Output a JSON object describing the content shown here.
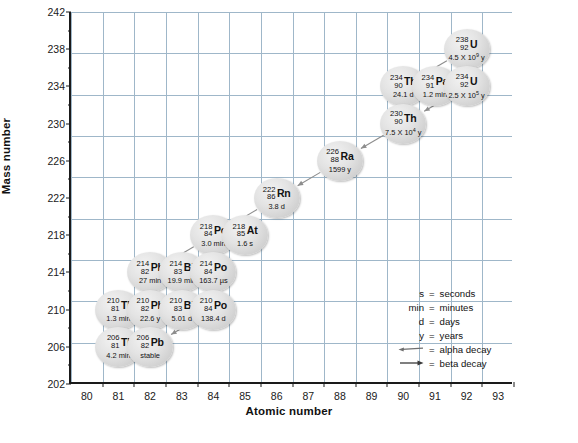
{
  "chart_data": {
    "type": "scatter",
    "title": "",
    "xlabel": "Atomic number",
    "ylabel": "Mass number",
    "xlim": [
      79,
      93
    ],
    "ylim": [
      202,
      242
    ],
    "xticks": [
      80,
      81,
      82,
      83,
      84,
      85,
      86,
      87,
      88,
      89,
      90,
      91,
      92,
      93
    ],
    "yticks": [
      202,
      206,
      210,
      214,
      218,
      222,
      226,
      230,
      234,
      238,
      242
    ],
    "y_minor_step": 2,
    "grid": true,
    "legend_position": "inside-lower-right",
    "nodes": [
      {
        "id": "U238",
        "z": 92,
        "a": 238,
        "element": "U",
        "halflife": "4.5 X 10",
        "exp": "9",
        "unit": "y"
      },
      {
        "id": "Th234",
        "z": 90,
        "a": 234,
        "element": "Th",
        "halflife": "24.1 d",
        "exp": "",
        "unit": ""
      },
      {
        "id": "Pa234",
        "z": 91,
        "a": 234,
        "element": "Pa",
        "halflife": "1.2 min",
        "exp": "",
        "unit": ""
      },
      {
        "id": "U234",
        "z": 92,
        "a": 234,
        "element": "U",
        "halflife": "2.5 X 10",
        "exp": "5",
        "unit": "y"
      },
      {
        "id": "Th230",
        "z": 90,
        "a": 230,
        "element": "Th",
        "halflife": "7.5 X 10",
        "exp": "4",
        "unit": "y"
      },
      {
        "id": "Ra226",
        "z": 88,
        "a": 226,
        "element": "Ra",
        "halflife": "1599 y",
        "exp": "",
        "unit": ""
      },
      {
        "id": "Rn222",
        "z": 86,
        "a": 222,
        "element": "Rn",
        "halflife": "3.8 d",
        "exp": "",
        "unit": ""
      },
      {
        "id": "Po218",
        "z": 84,
        "a": 218,
        "element": "Po",
        "halflife": "3.0 min",
        "exp": "",
        "unit": ""
      },
      {
        "id": "At218",
        "z": 85,
        "a": 218,
        "element": "At",
        "halflife": "1.6 s",
        "exp": "",
        "unit": ""
      },
      {
        "id": "Pb214",
        "z": 82,
        "a": 214,
        "element": "Pb",
        "halflife": "27 min",
        "exp": "",
        "unit": ""
      },
      {
        "id": "Bi214",
        "z": 83,
        "a": 214,
        "element": "Bi",
        "halflife": "19.9 min",
        "exp": "",
        "unit": ""
      },
      {
        "id": "Po214",
        "z": 84,
        "a": 214,
        "element": "Po",
        "halflife": "163.7 µs",
        "exp": "",
        "unit": ""
      },
      {
        "id": "Tl210",
        "z": 81,
        "a": 210,
        "element": "Tl",
        "halflife": "1.3 min",
        "exp": "",
        "unit": ""
      },
      {
        "id": "Pb210",
        "z": 82,
        "a": 210,
        "element": "Pb",
        "halflife": "22.6 y",
        "exp": "",
        "unit": ""
      },
      {
        "id": "Bi210",
        "z": 83,
        "a": 210,
        "element": "Bi",
        "halflife": "5.01 d",
        "exp": "",
        "unit": ""
      },
      {
        "id": "Po210",
        "z": 84,
        "a": 210,
        "element": "Po",
        "halflife": "138.4 d",
        "exp": "",
        "unit": ""
      },
      {
        "id": "Tl206",
        "z": 81,
        "a": 206,
        "element": "Tl",
        "halflife": "4.2 min",
        "exp": "",
        "unit": ""
      },
      {
        "id": "Pb206",
        "z": 82,
        "a": 206,
        "element": "Pb",
        "halflife": "stable",
        "exp": "",
        "unit": ""
      }
    ],
    "decays": [
      {
        "from": "U238",
        "to": "Th234",
        "type": "alpha"
      },
      {
        "from": "Th234",
        "to": "Pa234",
        "type": "beta"
      },
      {
        "from": "Pa234",
        "to": "U234",
        "type": "beta"
      },
      {
        "from": "U234",
        "to": "Th230",
        "type": "alpha"
      },
      {
        "from": "Th230",
        "to": "Ra226",
        "type": "alpha"
      },
      {
        "from": "Ra226",
        "to": "Rn222",
        "type": "alpha"
      },
      {
        "from": "Rn222",
        "to": "Po218",
        "type": "alpha"
      },
      {
        "from": "Po218",
        "to": "At218",
        "type": "beta"
      },
      {
        "from": "Po218",
        "to": "Pb214",
        "type": "alpha"
      },
      {
        "from": "At218",
        "to": "Bi214",
        "type": "alpha"
      },
      {
        "from": "Pb214",
        "to": "Bi214",
        "type": "beta"
      },
      {
        "from": "Bi214",
        "to": "Po214",
        "type": "beta"
      },
      {
        "from": "Bi214",
        "to": "Tl210",
        "type": "alpha"
      },
      {
        "from": "Po214",
        "to": "Pb210",
        "type": "alpha"
      },
      {
        "from": "Tl210",
        "to": "Pb210",
        "type": "beta"
      },
      {
        "from": "Pb210",
        "to": "Bi210",
        "type": "beta"
      },
      {
        "from": "Bi210",
        "to": "Po210",
        "type": "beta"
      },
      {
        "from": "Bi210",
        "to": "Tl206",
        "type": "alpha"
      },
      {
        "from": "Po210",
        "to": "Pb206",
        "type": "alpha"
      },
      {
        "from": "Tl206",
        "to": "Pb206",
        "type": "beta"
      }
    ]
  },
  "legend": {
    "rows": [
      {
        "left": "s",
        "right": "seconds"
      },
      {
        "left": "min",
        "right": "minutes"
      },
      {
        "left": "d",
        "right": "days"
      },
      {
        "left": "y",
        "right": "years"
      }
    ],
    "alpha": {
      "label": "alpha decay",
      "equals": "="
    },
    "beta": {
      "label": "beta decay",
      "equals": "="
    },
    "equals": "="
  },
  "colors": {
    "grid": "#9fb7c9",
    "axis": "#1a1a1a",
    "node_fill": "#dcdcdc",
    "arrow": "#6f6f6f",
    "text": "#111111"
  }
}
